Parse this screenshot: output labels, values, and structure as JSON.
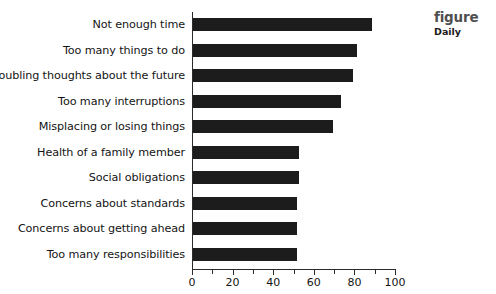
{
  "caption": {
    "title": "figure",
    "subtitle": "Daily"
  },
  "chart_data": {
    "type": "bar",
    "orientation": "horizontal",
    "title": "",
    "xlabel": "",
    "ylabel": "",
    "xlim": [
      0,
      100
    ],
    "grid": false,
    "legend": false,
    "bar_color": "#1c1c1c",
    "x_ticks": [
      0,
      10,
      20,
      30,
      40,
      50,
      60,
      70,
      80,
      90,
      100
    ],
    "x_tick_labels": [
      "0",
      "",
      "20",
      "",
      "40",
      "",
      "60",
      "",
      "80",
      "",
      "100"
    ],
    "categories": [
      "Not enough time",
      "Too many things to do",
      "Troubling thoughts about the future",
      "Too many interruptions",
      "Misplacing or losing things",
      "Health of a family member",
      "Social obligations",
      "Concerns about standards",
      "Concerns about getting ahead",
      "Too many responsibilities"
    ],
    "values": [
      88,
      81,
      79,
      73,
      69,
      52,
      52,
      51,
      51,
      51
    ]
  }
}
